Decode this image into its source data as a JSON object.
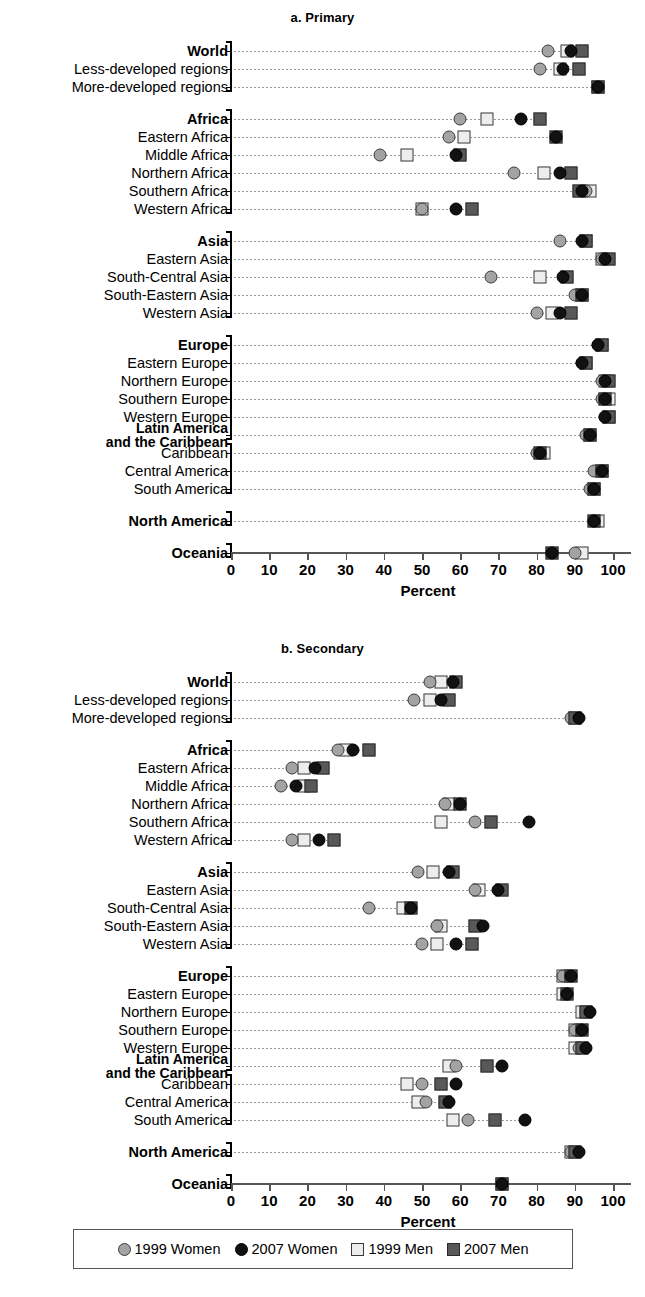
{
  "figure": {
    "panel_a_title": "a. Primary",
    "panel_b_title": "b. Secondary",
    "x_axis_title": "Percent",
    "x_ticks": [
      "0",
      "10",
      "20",
      "30",
      "40",
      "50",
      "60",
      "70",
      "80",
      "90",
      "100"
    ]
  },
  "legend": {
    "entries": [
      {
        "key": "w99",
        "label": "1999 Women",
        "icon": "circle-light-gray",
        "color": "#a3a3a3"
      },
      {
        "key": "w07",
        "label": "2007 Women",
        "icon": "circle-black",
        "color": "#111111"
      },
      {
        "key": "m99",
        "label": "1999 Men",
        "icon": "square-white",
        "color": "#ededed"
      },
      {
        "key": "m07",
        "label": "2007 Men",
        "icon": "square-dark-gray",
        "color": "#585858"
      }
    ]
  },
  "chart_data": [
    {
      "type": "scatter",
      "title": "a. Primary",
      "xlabel": "Percent",
      "ylabel": "",
      "xlim": [
        0,
        100
      ],
      "grid": true,
      "legend_position": "bottom",
      "series_names": [
        "1999 Women",
        "2007 Women",
        "1999 Men",
        "2007 Men"
      ],
      "categories": [
        "World",
        "Less-developed regions",
        "More-developed regions",
        "Africa",
        "Eastern Africa",
        "Middle Africa",
        "Northern Africa",
        "Southern Africa",
        "Western Africa",
        "Asia",
        "Eastern Asia",
        "South-Central Asia",
        "South-Eastern Asia",
        "Western Asia",
        "Europe",
        "Eastern Europe",
        "Northern Europe",
        "Southern Europe",
        "Western Europe",
        "Latin America and the Caribbean",
        "Caribbean",
        "Central America",
        "South America",
        "North America",
        "Oceania"
      ],
      "series": [
        {
          "name": "1999 Women",
          "values": [
            83,
            81,
            96,
            60,
            57,
            39,
            74,
            93,
            50,
            86,
            97,
            68,
            90,
            80,
            96,
            92,
            97,
            97,
            98,
            93,
            80,
            95,
            94,
            95,
            90
          ]
        },
        {
          "name": "2007 Women",
          "values": [
            89,
            87,
            96,
            76,
            85,
            59,
            86,
            92,
            59,
            92,
            98,
            87,
            92,
            86,
            96,
            92,
            98,
            98,
            98,
            94,
            81,
            97,
            95,
            95,
            84
          ]
        },
        {
          "name": "1999 Men",
          "values": [
            88,
            86,
            96,
            67,
            61,
            46,
            82,
            94,
            50,
            93,
            97,
            81,
            92,
            84,
            97,
            93,
            98,
            99,
            99,
            94,
            82,
            97,
            95,
            96,
            92
          ]
        },
        {
          "name": "2007 Men",
          "values": [
            92,
            91,
            96,
            81,
            85,
            60,
            89,
            91,
            63,
            93,
            99,
            88,
            92,
            89,
            97,
            93,
            99,
            98,
            99,
            94,
            81,
            97,
            95,
            95,
            84
          ]
        }
      ]
    },
    {
      "type": "scatter",
      "title": "b. Secondary",
      "xlabel": "Percent",
      "ylabel": "",
      "xlim": [
        0,
        100
      ],
      "grid": true,
      "legend_position": "bottom",
      "series_names": [
        "1999 Women",
        "2007 Women",
        "1999 Men",
        "2007 Men"
      ],
      "categories": [
        "World",
        "Less-developed regions",
        "More-developed regions",
        "Africa",
        "Eastern Africa",
        "Middle Africa",
        "Northern Africa",
        "Southern Africa",
        "Western Africa",
        "Asia",
        "Eastern Asia",
        "South-Central Asia",
        "South-Eastern Asia",
        "Western Asia",
        "Europe",
        "Eastern Europe",
        "Northern Europe",
        "Southern Europe",
        "Western Europe",
        "Latin America and the Caribbean",
        "Caribbean",
        "Central America",
        "South America",
        "North America",
        "Oceania"
      ],
      "series": [
        {
          "name": "1999 Women",
          "values": [
            52,
            48,
            89,
            28,
            16,
            13,
            56,
            64,
            16,
            49,
            64,
            36,
            54,
            50,
            87,
            88,
            93,
            90,
            91,
            59,
            50,
            51,
            62,
            89,
            71
          ]
        },
        {
          "name": "2007 Women",
          "values": [
            58,
            55,
            91,
            32,
            22,
            17,
            60,
            78,
            23,
            57,
            70,
            47,
            66,
            59,
            89,
            88,
            94,
            92,
            93,
            71,
            59,
            57,
            77,
            91,
            71
          ]
        },
        {
          "name": "1999 Men",
          "values": [
            55,
            52,
            90,
            30,
            19,
            19,
            57,
            55,
            19,
            53,
            65,
            45,
            55,
            54,
            87,
            87,
            92,
            90,
            90,
            57,
            46,
            49,
            58,
            89,
            71
          ]
        },
        {
          "name": "2007 Men",
          "values": [
            59,
            57,
            90,
            36,
            24,
            21,
            60,
            68,
            27,
            58,
            71,
            47,
            64,
            63,
            89,
            88,
            93,
            92,
            92,
            67,
            55,
            56,
            69,
            90,
            71
          ]
        }
      ]
    }
  ]
}
